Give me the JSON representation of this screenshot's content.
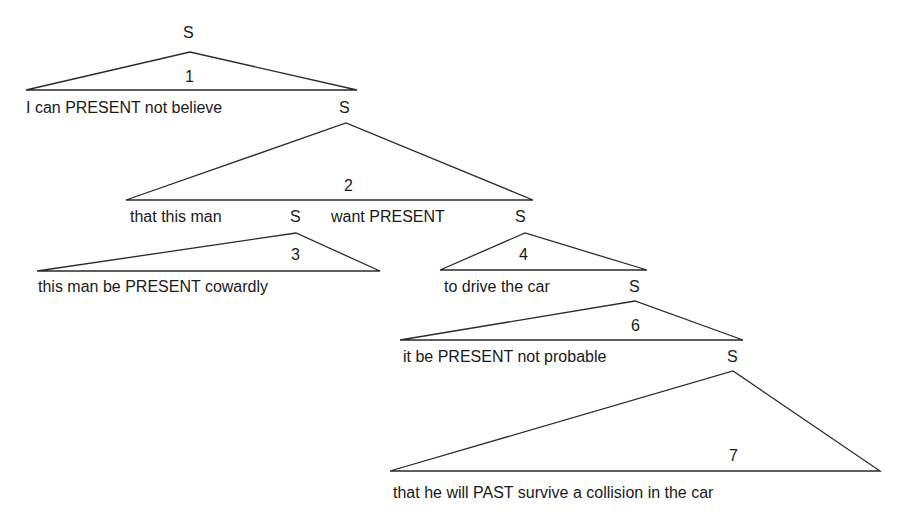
{
  "diagram": {
    "type": "syntax-tree",
    "root_label": "S",
    "nodes": [
      {
        "id": "1",
        "number": "1",
        "text": "I can PRESENT not believe",
        "child_s": "S"
      },
      {
        "id": "2",
        "number": "2",
        "text_a": "that this man",
        "s_a": "S",
        "text_b": "want PRESENT",
        "s_b": "S"
      },
      {
        "id": "3",
        "number": "3",
        "text": "this man be PRESENT cowardly"
      },
      {
        "id": "4",
        "number": "4",
        "text": "to drive the car",
        "child_s": "S"
      },
      {
        "id": "6",
        "number": "6",
        "text": "it be PRESENT not probable",
        "child_s": "S"
      },
      {
        "id": "7",
        "number": "7",
        "text": "that he will PAST survive a collision in the car"
      }
    ],
    "line_color": "#2a2a2a"
  }
}
